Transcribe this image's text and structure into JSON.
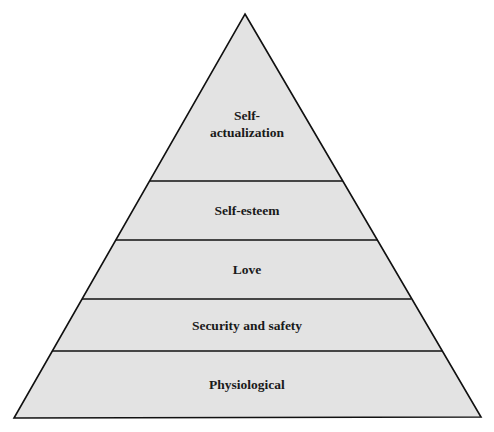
{
  "diagram": {
    "type": "pyramid",
    "colors": {
      "fill": "#e3e3e3",
      "stroke": "#111111",
      "text": "#1a1a1a",
      "background": "#ffffff"
    },
    "levels": [
      {
        "label_line1": "Self-",
        "label_line2": "actualization"
      },
      {
        "label": "Self-esteem"
      },
      {
        "label": "Love"
      },
      {
        "label": "Security and safety"
      },
      {
        "label": "Physiological"
      }
    ]
  }
}
